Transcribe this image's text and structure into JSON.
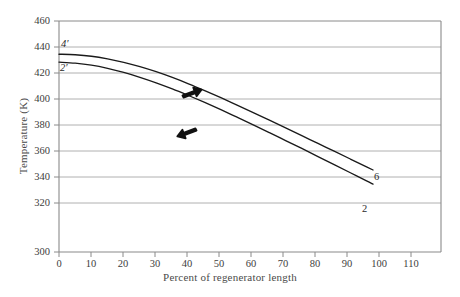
{
  "chart_data": {
    "type": "line",
    "title": "",
    "xlabel": "Percent of regenerator length",
    "ylabel": "Temperature (K)",
    "xlim": [
      0,
      118
    ],
    "ylim": [
      300,
      460
    ],
    "grid": true,
    "grid_axis": "y",
    "legend": "none",
    "x_ticks": [
      0,
      10,
      20,
      30,
      40,
      50,
      60,
      70,
      80,
      90,
      100,
      110
    ],
    "y_ticks": [
      300,
      320,
      340,
      360,
      380,
      400,
      420,
      440,
      460
    ],
    "series": [
      {
        "name": "6",
        "start_label": "4'",
        "end_label": "6",
        "color": "#1a1a1a",
        "x": [
          0,
          5,
          10,
          15,
          20,
          25,
          30,
          35,
          40,
          45,
          50,
          55,
          60,
          65,
          70,
          75,
          80,
          85,
          90,
          95,
          97
        ],
        "y": [
          437.0,
          436.6,
          435.6,
          433.8,
          431.4,
          428.4,
          424.9,
          420.9,
          416.5,
          411.8,
          406.9,
          401.8,
          396.6,
          391.3,
          386.0,
          380.6,
          375.2,
          369.8,
          364.4,
          359.0,
          356.8
        ]
      },
      {
        "name": "2",
        "start_label": "2'",
        "end_label": "2",
        "color": "#1a1a1a",
        "x": [
          0,
          5,
          10,
          15,
          20,
          25,
          30,
          35,
          40,
          45,
          50,
          55,
          60,
          65,
          70,
          75,
          80,
          85,
          90,
          95,
          97
        ],
        "y": [
          431.5,
          430.8,
          429.4,
          427.2,
          424.4,
          421.0,
          417.2,
          413.0,
          408.4,
          403.6,
          398.6,
          393.4,
          388.1,
          382.7,
          377.2,
          371.7,
          366.1,
          360.5,
          354.9,
          349.3,
          347.0
        ]
      }
    ],
    "annotations": [
      {
        "name": "flow-arrow-upper",
        "direction": "right",
        "x": 41.5,
        "y": 405.0
      },
      {
        "name": "flow-arrow-lower",
        "direction": "left",
        "x": 40.0,
        "y": 387.0
      }
    ],
    "curve_endpoint_labels": [
      {
        "text": "4'",
        "x": 1.0,
        "y": 441.5,
        "anchor": "start-upper"
      },
      {
        "text": "2'",
        "x": 0.7,
        "y": 425.0,
        "anchor": "start-lower"
      },
      {
        "text": "6",
        "x": 99.5,
        "y": 355.5,
        "anchor": "end-upper"
      },
      {
        "text": "2",
        "x": 96.0,
        "y": 339.5,
        "anchor": "end-lower"
      }
    ]
  },
  "axes": {
    "x_title": "Percent of regenerator length",
    "y_title": "Temperature (K)",
    "y_labels": [
      "460",
      "440",
      "420",
      "400",
      "380",
      "360",
      "340",
      "320",
      "300"
    ],
    "x_labels": [
      "0",
      "10",
      "20",
      "30",
      "40",
      "50",
      "60",
      "70",
      "80",
      "90",
      "100",
      "110"
    ]
  },
  "labels": {
    "curve_start_upper": "4′",
    "curve_start_lower": "2′",
    "curve_end_upper": "6",
    "curve_end_lower": "2"
  },
  "colors": {
    "curve": "#1a1a1a",
    "grid": "#9a9a9a",
    "frame": "#8a8a8a",
    "text": "#3d3d3d",
    "background": "#ffffff"
  }
}
